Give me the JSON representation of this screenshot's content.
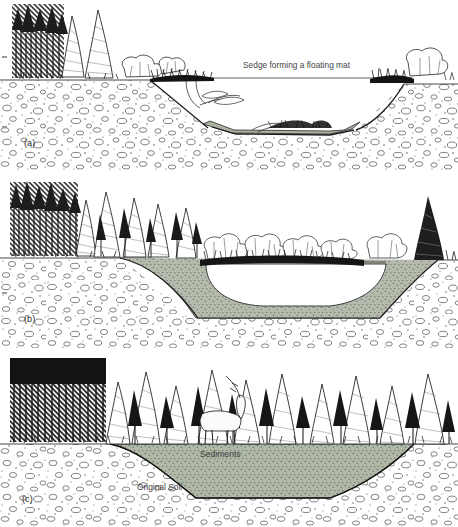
{
  "figure": {
    "type": "scientific line-art diagram",
    "panel_count": 3,
    "background_color": "#ffffff",
    "ink_color": "#1a1a1a",
    "sediment_fill_color": "#a8b0a0",
    "soil_stipple_color": "#5a5a5a"
  },
  "panels": [
    {
      "id": "a",
      "label": "(a)",
      "stage": "young pond with open water and floating sedge mat",
      "annotations": [
        {
          "name": "sedge-mat-label",
          "text": "Sedge forming a floating mat"
        }
      ],
      "features": [
        "dark conifer forest at upper left",
        "shrubs along both banks",
        "broad deep open-water basin",
        "thin sediment layer on basin floor",
        "submerged aquatic plants near left shore",
        "stippled original soil / gravel matrix"
      ]
    },
    {
      "id": "b",
      "label": "(b)",
      "stage": "partially filled pond, sediments encroaching, shrinking open water",
      "annotations": [],
      "features": [
        "conifer forest spreading rightward along the rim",
        "shrub thicket across the basin margin",
        "thick wedge of sediment filling left and bottom of basin",
        "reduced central open-water pool",
        "stippled original soil / gravel matrix"
      ]
    },
    {
      "id": "c",
      "label": "(c)",
      "stage": "completely filled basin, forest established over sediments",
      "annotations": [
        {
          "name": "sediments-label",
          "text": "Sediments"
        },
        {
          "name": "original-soil-label",
          "text": "Original Soil"
        }
      ],
      "features": [
        "continuous conifer forest across the entire width",
        "deer standing among the trees",
        "basin entirely filled with sediment",
        "no open water remaining",
        "stippled original soil / gravel matrix"
      ]
    }
  ]
}
